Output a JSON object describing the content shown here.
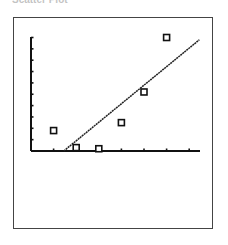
{
  "caption": "Scatter Plot",
  "chart_data": {
    "type": "scatter",
    "title": "",
    "xlabel": "",
    "ylabel": "",
    "xlim": [
      0,
      7.5
    ],
    "ylim": [
      0,
      10
    ],
    "grid": false,
    "x_ticks": 7,
    "y_ticks": 10,
    "series": [
      {
        "name": "data",
        "marker": "square",
        "points": [
          {
            "x": 1,
            "y": 1.8
          },
          {
            "x": 2,
            "y": 0.3
          },
          {
            "x": 3,
            "y": 0.2
          },
          {
            "x": 4,
            "y": 2.5
          },
          {
            "x": 5,
            "y": 5.2
          },
          {
            "x": 6,
            "y": 10
          }
        ]
      },
      {
        "name": "regression line",
        "type": "line",
        "points": [
          {
            "x": 1.45,
            "y": 0
          },
          {
            "x": 7.45,
            "y": 9.8
          }
        ]
      }
    ]
  },
  "layout": {
    "origin_px": [
      31,
      151
    ],
    "x_unit_px": 22.6,
    "y_unit_px": 11.35,
    "x_axis_end_px": 200,
    "y_axis_top_px": 37
  }
}
